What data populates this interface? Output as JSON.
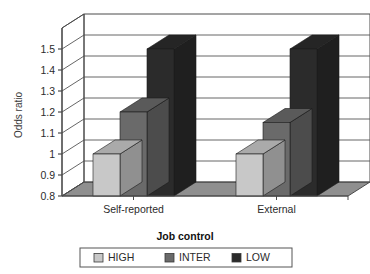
{
  "chart_data": {
    "type": "bar",
    "title": "",
    "xlabel": "Job control",
    "ylabel": "Odds ratio",
    "categories": [
      "Self-reported",
      "External"
    ],
    "series": [
      {
        "name": "HIGH",
        "values": [
          1.0,
          1.0
        ],
        "color": "#c8c8c8"
      },
      {
        "name": "INTER",
        "values": [
          1.2,
          1.15
        ],
        "color": "#6a6a6a"
      },
      {
        "name": "LOW",
        "values": [
          1.5,
          1.5
        ],
        "color": "#2b2b2b"
      }
    ],
    "ylim": [
      0.8,
      1.6
    ],
    "ytick_labels": [
      "0.8",
      "0.9",
      "1",
      "1.1",
      "1.2",
      "1.3",
      "1.4",
      "1.5"
    ],
    "ytick_values": [
      0.8,
      0.9,
      1.0,
      1.1,
      1.2,
      1.3,
      1.4,
      1.5
    ],
    "grid": true,
    "three_d": true,
    "legend_position": "bottom"
  },
  "axis": {
    "y_title": "Odds ratio",
    "x_title": "Job control",
    "tick_0": "0.8",
    "tick_1": "0.9",
    "tick_2": "1",
    "tick_3": "1.1",
    "tick_4": "1.2",
    "tick_5": "1.3",
    "tick_6": "1.4",
    "tick_7": "1.5",
    "cat_0": "Self-reported",
    "cat_1": "External"
  },
  "legend": {
    "items": [
      {
        "label": "HIGH",
        "color": "#c8c8c8"
      },
      {
        "label": "INTER",
        "color": "#6a6a6a"
      },
      {
        "label": "LOW",
        "color": "#2b2b2b"
      }
    ],
    "item_0_label": "HIGH",
    "item_1_label": "INTER",
    "item_2_label": "LOW"
  },
  "colors": {
    "high": "#c8c8c8",
    "inter": "#6a6a6a",
    "low": "#2b2b2b",
    "floor": "#8f8f8f",
    "axis": "#4a4a4a",
    "grid": "#555555",
    "background": "#ffffff"
  }
}
